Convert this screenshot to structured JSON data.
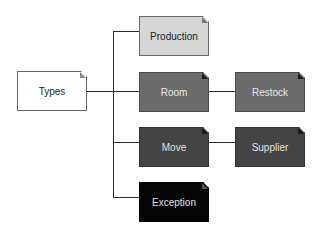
{
  "diagram": {
    "type": "hierarchy-tree",
    "root": {
      "label": "Types",
      "color": "#ffffff"
    },
    "nodes": [
      {
        "id": "production",
        "label": "Production",
        "parent": "Types",
        "color": "#d6d6d6"
      },
      {
        "id": "room",
        "label": "Room",
        "parent": "Types",
        "color": "#6b6b6b"
      },
      {
        "id": "restock",
        "label": "Restock",
        "parent": "Room",
        "color": "#6b6b6b"
      },
      {
        "id": "move",
        "label": "Move",
        "parent": "Types",
        "color": "#444444"
      },
      {
        "id": "supplier",
        "label": "Supplier",
        "parent": "Move",
        "color": "#444444"
      },
      {
        "id": "exception",
        "label": "Exception",
        "parent": "Types",
        "color": "#050505"
      }
    ]
  }
}
